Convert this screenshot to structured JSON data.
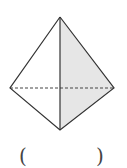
{
  "figure": {
    "type": "triangular-pyramid",
    "vertices": {
      "top": [
        60,
        17
      ],
      "left": [
        10,
        88
      ],
      "right": [
        114,
        88
      ],
      "bottom": [
        60,
        130
      ]
    },
    "colors": {
      "stroke": "#333333",
      "shaded_face": "#e6e6e6",
      "background": "#ffffff"
    }
  },
  "answer_blank": {
    "left_paren": "(",
    "right_paren": ")",
    "content": ""
  }
}
